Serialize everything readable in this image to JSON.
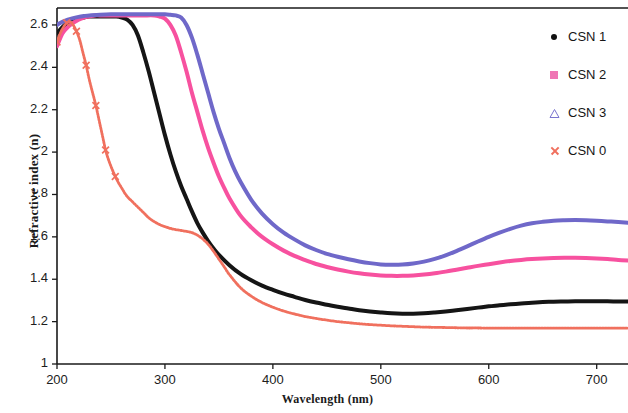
{
  "chart_data": {
    "type": "line",
    "title": "",
    "xlabel": "Wavelength (nm)",
    "ylabel": "Refractive index (n)",
    "xlim": [
      200,
      729
    ],
    "ylim": [
      1,
      2.68
    ],
    "grid": false,
    "legend_position": "top-right",
    "xticks": [
      200,
      300,
      400,
      500,
      600,
      700
    ],
    "yticks": [
      1,
      1.2,
      1.4,
      1.6,
      1.8,
      2,
      2.2,
      2.4,
      2.6
    ],
    "xtick_labels": [
      "200",
      "300",
      "400",
      "500",
      "600",
      "700"
    ],
    "ytick_labels": [
      "1",
      "1.2",
      "1.4",
      "1.6",
      "1.8",
      "2",
      "2.2",
      "2.4",
      "2.6"
    ],
    "series": [
      {
        "name": "CSN 1",
        "color": "#151515",
        "marker": "dot",
        "x": [
          200,
          205,
          210,
          215,
          220,
          225,
          230,
          235,
          240,
          245,
          250,
          255,
          260,
          265,
          270,
          275,
          280,
          285,
          290,
          295,
          300,
          305,
          310,
          315,
          320,
          325,
          330,
          335,
          340,
          345,
          350,
          360,
          370,
          380,
          390,
          400,
          410,
          420,
          430,
          440,
          450,
          460,
          470,
          480,
          490,
          500,
          510,
          520,
          530,
          540,
          550,
          560,
          570,
          580,
          590,
          600,
          610,
          620,
          630,
          640,
          650,
          660,
          670,
          680,
          690,
          700,
          710,
          720,
          729
        ],
        "y": [
          2.56,
          2.59,
          2.61,
          2.62,
          2.63,
          2.635,
          2.64,
          2.64,
          2.64,
          2.64,
          2.64,
          2.64,
          2.635,
          2.625,
          2.6,
          2.55,
          2.47,
          2.38,
          2.28,
          2.18,
          2.08,
          1.99,
          1.91,
          1.84,
          1.78,
          1.72,
          1.665,
          1.62,
          1.58,
          1.545,
          1.515,
          1.465,
          1.425,
          1.395,
          1.37,
          1.35,
          1.332,
          1.317,
          1.302,
          1.29,
          1.28,
          1.27,
          1.262,
          1.254,
          1.248,
          1.243,
          1.239,
          1.237,
          1.237,
          1.239,
          1.243,
          1.248,
          1.254,
          1.26,
          1.266,
          1.272,
          1.277,
          1.282,
          1.286,
          1.289,
          1.292,
          1.294,
          1.295,
          1.296,
          1.296,
          1.296,
          1.296,
          1.295,
          1.295
        ]
      },
      {
        "name": "CSN 2",
        "color": "#f7519f",
        "marker": "square",
        "x": [
          200,
          205,
          210,
          215,
          220,
          225,
          230,
          235,
          240,
          250,
          260,
          270,
          280,
          290,
          295,
          300,
          305,
          310,
          315,
          320,
          325,
          330,
          335,
          340,
          345,
          350,
          355,
          360,
          370,
          380,
          390,
          400,
          410,
          420,
          430,
          440,
          450,
          460,
          470,
          480,
          490,
          500,
          510,
          520,
          530,
          540,
          550,
          560,
          570,
          580,
          590,
          600,
          610,
          620,
          630,
          640,
          650,
          660,
          670,
          680,
          690,
          700,
          710,
          720,
          729
        ],
        "y": [
          2.5,
          2.56,
          2.59,
          2.61,
          2.625,
          2.635,
          2.64,
          2.645,
          2.645,
          2.645,
          2.645,
          2.645,
          2.645,
          2.645,
          2.64,
          2.63,
          2.6,
          2.55,
          2.47,
          2.38,
          2.28,
          2.19,
          2.1,
          2.02,
          1.95,
          1.885,
          1.83,
          1.78,
          1.7,
          1.645,
          1.6,
          1.565,
          1.535,
          1.51,
          1.49,
          1.472,
          1.458,
          1.446,
          1.436,
          1.428,
          1.422,
          1.418,
          1.416,
          1.416,
          1.418,
          1.422,
          1.428,
          1.436,
          1.445,
          1.454,
          1.463,
          1.471,
          1.479,
          1.486,
          1.491,
          1.495,
          1.498,
          1.5,
          1.501,
          1.501,
          1.5,
          1.498,
          1.495,
          1.491,
          1.488
        ]
      },
      {
        "name": "CSN 3",
        "color": "#6f68c9",
        "marker": "triangle",
        "x": [
          200,
          205,
          210,
          215,
          220,
          225,
          230,
          240,
          250,
          260,
          270,
          280,
          290,
          300,
          305,
          310,
          315,
          320,
          325,
          330,
          335,
          340,
          345,
          350,
          355,
          360,
          365,
          370,
          380,
          390,
          400,
          410,
          420,
          430,
          440,
          450,
          460,
          470,
          480,
          490,
          500,
          510,
          520,
          530,
          540,
          550,
          560,
          570,
          580,
          590,
          600,
          610,
          620,
          630,
          640,
          650,
          660,
          670,
          680,
          690,
          700,
          710,
          720,
          729
        ],
        "y": [
          2.6,
          2.615,
          2.625,
          2.632,
          2.638,
          2.642,
          2.645,
          2.648,
          2.65,
          2.65,
          2.65,
          2.65,
          2.65,
          2.65,
          2.648,
          2.645,
          2.635,
          2.6,
          2.54,
          2.46,
          2.37,
          2.28,
          2.19,
          2.11,
          2.04,
          1.97,
          1.91,
          1.86,
          1.775,
          1.71,
          1.66,
          1.62,
          1.588,
          1.56,
          1.538,
          1.52,
          1.506,
          1.494,
          1.484,
          1.476,
          1.47,
          1.468,
          1.469,
          1.474,
          1.483,
          1.496,
          1.513,
          1.533,
          1.555,
          1.578,
          1.6,
          1.62,
          1.638,
          1.653,
          1.664,
          1.671,
          1.676,
          1.678,
          1.679,
          1.678,
          1.676,
          1.673,
          1.67,
          1.667
        ]
      },
      {
        "name": "CSN 0",
        "color": "#f0705e",
        "marker": "x",
        "x": [
          200,
          203,
          206,
          209,
          212,
          215,
          218,
          221,
          224,
          227,
          230,
          233,
          236,
          239,
          242,
          245,
          248,
          251,
          254,
          257,
          260,
          263,
          266,
          269,
          272,
          275,
          278,
          281,
          285,
          290,
          295,
          300,
          305,
          310,
          315,
          320,
          325,
          330,
          335,
          340,
          345,
          350,
          355,
          360,
          370,
          380,
          390,
          400,
          410,
          420,
          430,
          440,
          450,
          460,
          470,
          480,
          490,
          500,
          510,
          520,
          530,
          540,
          550,
          560,
          570,
          580,
          590,
          600,
          610,
          620,
          630,
          640,
          650,
          660,
          670,
          680,
          690,
          700,
          710,
          720,
          729
        ],
        "y": [
          2.52,
          2.56,
          2.59,
          2.61,
          2.615,
          2.6,
          2.57,
          2.53,
          2.47,
          2.41,
          2.34,
          2.28,
          2.22,
          2.15,
          2.08,
          2.01,
          1.96,
          1.92,
          1.885,
          1.855,
          1.83,
          1.805,
          1.785,
          1.77,
          1.755,
          1.74,
          1.725,
          1.71,
          1.69,
          1.672,
          1.658,
          1.648,
          1.64,
          1.634,
          1.63,
          1.626,
          1.62,
          1.608,
          1.59,
          1.565,
          1.532,
          1.495,
          1.458,
          1.42,
          1.36,
          1.32,
          1.29,
          1.268,
          1.25,
          1.236,
          1.224,
          1.215,
          1.207,
          1.2,
          1.195,
          1.19,
          1.186,
          1.183,
          1.18,
          1.178,
          1.176,
          1.174,
          1.173,
          1.172,
          1.171,
          1.17,
          1.17,
          1.169,
          1.169,
          1.169,
          1.169,
          1.169,
          1.169,
          1.169,
          1.169,
          1.169,
          1.169,
          1.169,
          1.169,
          1.169,
          1.169
        ]
      }
    ]
  },
  "legend": {
    "items": [
      {
        "label": "CSN 1",
        "marker": "dot-marker"
      },
      {
        "label": "CSN 2",
        "marker": "square-marker"
      },
      {
        "label": "CSN 3",
        "marker": "triangle-marker"
      },
      {
        "label": "CSN 0",
        "marker": "x-marker"
      }
    ]
  }
}
